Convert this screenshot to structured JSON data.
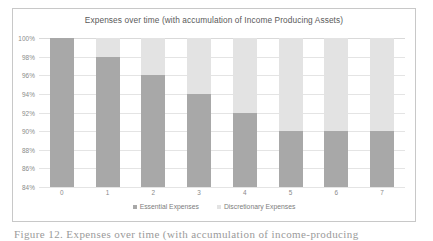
{
  "figure": {
    "caption_partial": "Figure 12.  Expenses over time (with accumulation of income-producing"
  },
  "chart_data": {
    "type": "bar",
    "stacked": true,
    "title": "Expenses over time (with accumulation of Income Producing Assets)",
    "xlabel": "",
    "ylabel": "",
    "categories": [
      "0",
      "1",
      "2",
      "3",
      "4",
      "5",
      "6",
      "7"
    ],
    "ylim": [
      84,
      100
    ],
    "ytick_labels": [
      "100%",
      "98%",
      "96%",
      "94%",
      "92%",
      "90%",
      "88%",
      "86%",
      "84%"
    ],
    "ytick_values": [
      100,
      98,
      96,
      94,
      92,
      90,
      88,
      86,
      84
    ],
    "ytick_suffix": "%",
    "grid": true,
    "legend_position": "bottom",
    "series": [
      {
        "name": "Essential Expenses",
        "color": "#a8a8a8",
        "values": [
          100,
          98,
          96,
          94,
          92,
          90,
          90,
          90
        ]
      },
      {
        "name": "Discretionary Expenses",
        "color": "#e3e3e3",
        "values": [
          0,
          2,
          4,
          6,
          8,
          10,
          10,
          10
        ]
      }
    ]
  },
  "colors": {
    "frame_border": "#c8c8c8",
    "gridline": "#e4e4e4",
    "title_text": "#5a5a5a",
    "tick_text": "#8a8a8a",
    "legend_text": "#7d7d7d",
    "plot_background": "#ffffff"
  }
}
